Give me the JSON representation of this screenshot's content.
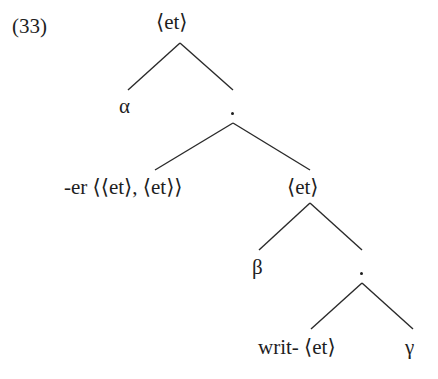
{
  "example_number": "(33)",
  "tree": {
    "root": {
      "label": "⟨et⟩"
    },
    "level1": {
      "left": {
        "label": "α"
      },
      "right": {
        "label": "."
      }
    },
    "level2": {
      "left": {
        "label": "-er ⟨⟨et⟩, ⟨et⟩⟩"
      },
      "right": {
        "label": "⟨et⟩"
      }
    },
    "level3": {
      "left": {
        "label": "β"
      },
      "right": {
        "label": "."
      }
    },
    "level4": {
      "left": {
        "label": "writ- ⟨et⟩"
      },
      "right": {
        "label": "γ"
      }
    }
  },
  "colors": {
    "ink": "#1e1e1e",
    "background": "#ffffff"
  }
}
